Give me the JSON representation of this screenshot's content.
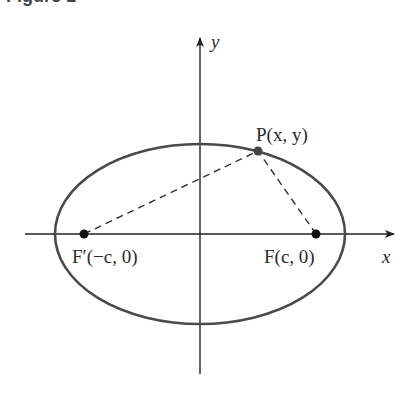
{
  "caption": "Figure 1",
  "axes": {
    "x_label": "x",
    "y_label": "y"
  },
  "points": {
    "P": {
      "label": "P(x, y)"
    },
    "F": {
      "label": "F(c, 0)"
    },
    "F_prime": {
      "label": "F′(−c, 0)"
    }
  },
  "geometry": {
    "center": [
      200,
      234
    ],
    "rx": 145,
    "ry": 90,
    "F_prime": [
      84,
      234
    ],
    "F": [
      316,
      234
    ],
    "P": [
      258,
      151
    ]
  },
  "colors": {
    "ellipse": "#4a4a4a",
    "axis": "#222222",
    "dash": "#333333"
  }
}
